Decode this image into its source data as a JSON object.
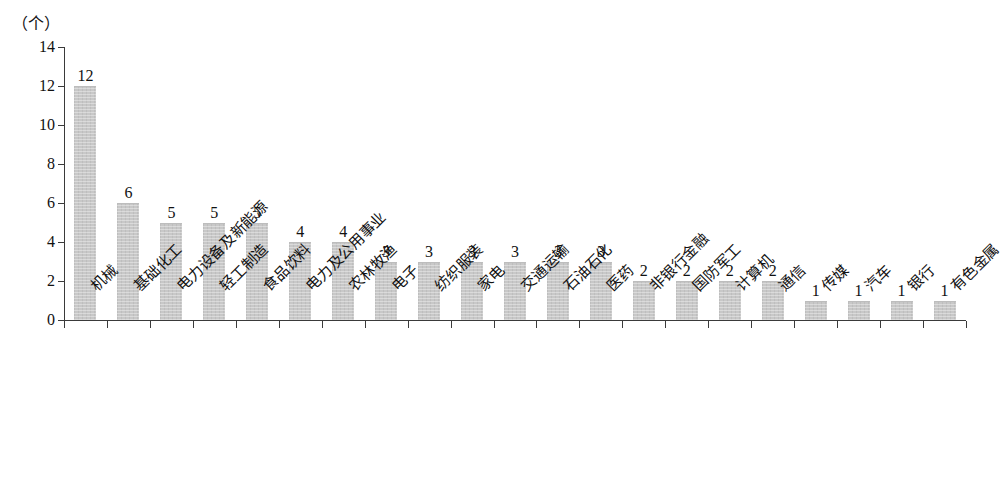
{
  "chart_data": {
    "type": "bar",
    "title": "",
    "subtitle": "",
    "unit_label": "（个）",
    "xlabel": "",
    "ylabel": "",
    "ylim": [
      0,
      14
    ],
    "ytick_step": 2,
    "yticks": [
      0,
      2,
      4,
      6,
      8,
      10,
      12,
      14
    ],
    "grid": false,
    "legend": false,
    "bar_color": "#c8c8c8",
    "axis_color": "#3a3a3a",
    "text_color": "#111111",
    "categories": [
      "机械",
      "基础化工",
      "电力设备及新能源",
      "轻工制造",
      "食品饮料",
      "电力及公用事业",
      "农林牧渔",
      "电子",
      "纺织服装",
      "家电",
      "交通运输",
      "石油石化",
      "医药",
      "非银行金融",
      "国防军工",
      "计算机",
      "通信",
      "传媒",
      "汽车",
      "银行",
      "有色金属"
    ],
    "values": [
      12,
      6,
      5,
      5,
      5,
      4,
      4,
      3,
      3,
      3,
      3,
      3,
      3,
      2,
      2,
      2,
      2,
      1,
      1,
      1,
      1
    ],
    "data_labels": [
      "12",
      "6",
      "5",
      "5",
      "5",
      "4",
      "4",
      "3",
      "3",
      "3",
      "3",
      "3",
      "3",
      "2",
      "2",
      "2",
      "2",
      "1",
      "1",
      "1",
      "1"
    ]
  }
}
